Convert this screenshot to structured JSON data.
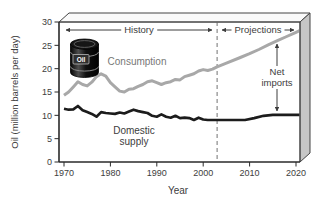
{
  "figure": {
    "bg": "#ffffff",
    "icon": {
      "name": "oil-barrel",
      "label": "Oil"
    },
    "colors": {
      "consumption_line": "#a8a8a8",
      "supply_line": "#1c1c1c",
      "axis": "#2a2a2a",
      "text": "#3d3d3d",
      "divider": "#8a8a8a",
      "right_face": "#c6c6c6",
      "top_face": "#fafafa"
    }
  },
  "chart_data": {
    "type": "line",
    "title": "",
    "xlabel": "Year",
    "ylabel": "Oil (million barrels per day)",
    "xlim": [
      1970,
      2020
    ],
    "ylim": [
      0,
      30
    ],
    "x_ticks": [
      1970,
      1980,
      1990,
      2000,
      2010,
      2020
    ],
    "y_ticks": [
      0,
      5,
      10,
      15,
      20,
      25,
      30
    ],
    "grid": false,
    "legend": "inline-labels",
    "history_projection_divider_year": 2003,
    "annotations": {
      "history": "History",
      "projections": "Projections",
      "net_imports": "Net imports",
      "consumption": "Consumption",
      "domestic_supply": "Domestic supply"
    },
    "series": [
      {
        "name": "Consumption",
        "color": "#a8a8a8",
        "width": 3,
        "points": [
          [
            1970,
            14.3
          ],
          [
            1971,
            15.0
          ],
          [
            1972,
            16.1
          ],
          [
            1973,
            17.2
          ],
          [
            1974,
            16.6
          ],
          [
            1975,
            16.3
          ],
          [
            1976,
            17.1
          ],
          [
            1977,
            18.3
          ],
          [
            1978,
            18.9
          ],
          [
            1979,
            18.4
          ],
          [
            1980,
            17.0
          ],
          [
            1981,
            16.1
          ],
          [
            1982,
            15.2
          ],
          [
            1983,
            15.0
          ],
          [
            1984,
            15.6
          ],
          [
            1985,
            15.7
          ],
          [
            1986,
            16.2
          ],
          [
            1987,
            16.6
          ],
          [
            1988,
            17.2
          ],
          [
            1989,
            17.4
          ],
          [
            1990,
            17.0
          ],
          [
            1991,
            16.6
          ],
          [
            1992,
            17.0
          ],
          [
            1993,
            17.2
          ],
          [
            1994,
            17.7
          ],
          [
            1995,
            17.6
          ],
          [
            1996,
            18.3
          ],
          [
            1997,
            18.6
          ],
          [
            1998,
            18.9
          ],
          [
            1999,
            19.5
          ],
          [
            2000,
            19.8
          ],
          [
            2001,
            19.6
          ],
          [
            2002,
            19.9
          ],
          [
            2003,
            20.4
          ],
          [
            2005,
            21.2
          ],
          [
            2008,
            22.4
          ],
          [
            2010,
            23.2
          ],
          [
            2012,
            24.1
          ],
          [
            2014,
            25.1
          ],
          [
            2016,
            26.0
          ],
          [
            2018,
            26.9
          ],
          [
            2020,
            27.8
          ]
        ]
      },
      {
        "name": "Domestic supply",
        "color": "#1c1c1c",
        "width": 2.7,
        "points": [
          [
            1970,
            11.4
          ],
          [
            1971,
            11.2
          ],
          [
            1972,
            11.3
          ],
          [
            1973,
            12.0
          ],
          [
            1974,
            11.1
          ],
          [
            1975,
            10.7
          ],
          [
            1976,
            10.3
          ],
          [
            1977,
            9.7
          ],
          [
            1978,
            10.7
          ],
          [
            1979,
            10.5
          ],
          [
            1980,
            10.4
          ],
          [
            1981,
            10.3
          ],
          [
            1982,
            10.6
          ],
          [
            1983,
            10.4
          ],
          [
            1984,
            10.8
          ],
          [
            1985,
            11.2
          ],
          [
            1986,
            10.9
          ],
          [
            1987,
            10.7
          ],
          [
            1988,
            10.5
          ],
          [
            1989,
            9.9
          ],
          [
            1990,
            9.7
          ],
          [
            1991,
            10.2
          ],
          [
            1992,
            9.7
          ],
          [
            1993,
            9.5
          ],
          [
            1994,
            9.9
          ],
          [
            1995,
            9.4
          ],
          [
            1996,
            9.5
          ],
          [
            1997,
            9.4
          ],
          [
            1998,
            9.0
          ],
          [
            1999,
            9.5
          ],
          [
            2000,
            9.1
          ],
          [
            2001,
            9.0
          ],
          [
            2002,
            9.0
          ],
          [
            2003,
            9.0
          ],
          [
            2006,
            9.0
          ],
          [
            2009,
            9.0
          ],
          [
            2011,
            9.4
          ],
          [
            2013,
            9.9
          ],
          [
            2015,
            10.1
          ],
          [
            2020,
            10.1
          ]
        ]
      }
    ]
  }
}
